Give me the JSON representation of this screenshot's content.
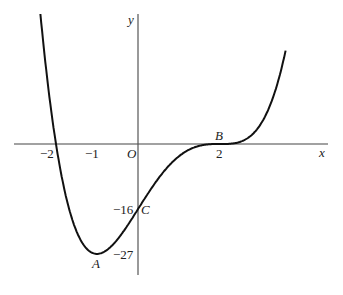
{
  "chart_data": {
    "type": "line",
    "title": "",
    "function": "y = (x+2)(x-2)^3",
    "xlabel": "x",
    "ylabel": "y",
    "origin_label": "O",
    "xlim": [
      -2.55,
      4.6
    ],
    "ylim": [
      -33,
      35
    ],
    "grid": false,
    "x_tick_labels": [
      "−2",
      "−1",
      "2"
    ],
    "x_ticks": [
      -2,
      -1,
      2
    ],
    "y_tick_labels": [
      "−16",
      "−27"
    ],
    "y_ticks": [
      -16,
      -27
    ],
    "points": [
      {
        "label": "A",
        "x": -1,
        "y": -27,
        "description": "minimum"
      },
      {
        "label": "B",
        "x": 2,
        "y": 0,
        "description": "stationary point of inflection"
      },
      {
        "label": "C",
        "x": 0,
        "y": -16,
        "description": "y-intercept"
      }
    ],
    "x_intercepts": [
      -2,
      2
    ],
    "series": [
      {
        "name": "curve",
        "x": [
          -2.4,
          -2.2,
          -2,
          -1.5,
          -1,
          -0.5,
          0,
          0.5,
          1,
          1.5,
          2,
          2.5,
          3,
          3.3,
          3.6
        ],
        "values": [
          35.7,
          13.5,
          0,
          -21.4,
          -27,
          -25.6,
          -16,
          -6.75,
          -3,
          -0.44,
          0,
          0.56,
          5,
          11.5,
          23
        ]
      }
    ]
  },
  "labels": {
    "y_axis": "y",
    "x_axis": "x",
    "origin": "O",
    "xm2": "−2",
    "xm1": "−1",
    "x2": "2",
    "ym16": "−16",
    "ym27": "−27",
    "A": "A",
    "B": "B",
    "C": "C"
  }
}
